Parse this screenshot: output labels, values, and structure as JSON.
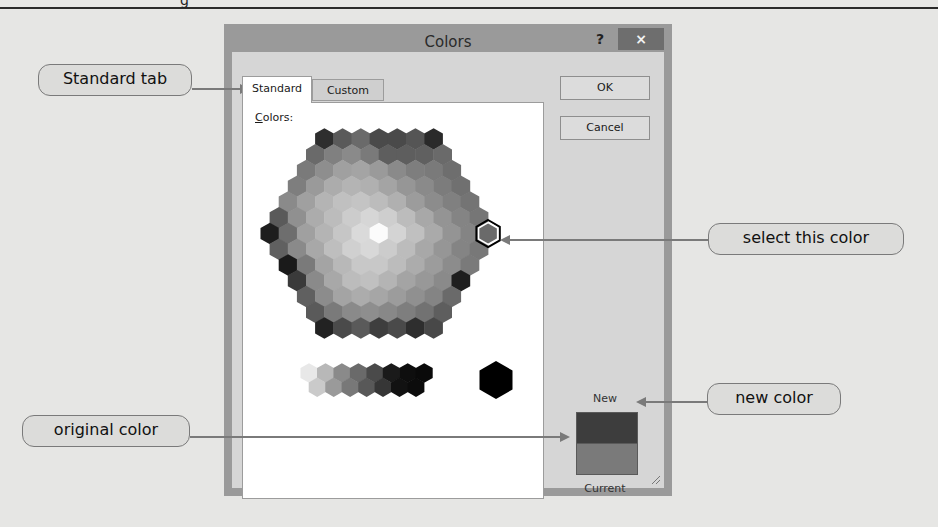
{
  "page": {
    "heading_fragment": "g"
  },
  "dialog": {
    "title": "Colors",
    "help_label": "?",
    "close_label": "×",
    "tabs": [
      {
        "label": "Standard",
        "active": true
      },
      {
        "label": "Custom",
        "active": false
      }
    ],
    "colors_label_accel": "C",
    "colors_label_rest": "olors:",
    "buttons": {
      "ok": "OK",
      "cancel": "Cancel"
    },
    "preview": {
      "new_label": "New",
      "current_label": "Current",
      "new_color": "#3d3d3d",
      "current_color": "#7a7a7a"
    },
    "selected_swatch": {
      "row": 6,
      "col": 12
    }
  },
  "callouts": [
    {
      "id": "standard-tab",
      "label": "Standard tab"
    },
    {
      "id": "select-this-color",
      "label": "select this color"
    },
    {
      "id": "new-color",
      "label": "new color"
    },
    {
      "id": "original-color",
      "label": "original color"
    }
  ],
  "hex_rows": [
    [
      "#2e2e2e",
      "#5a5a5a",
      "#6a6a6a",
      "#4a4a4a",
      "#4a4a4a",
      "#555555",
      "#2a2a2a"
    ],
    [
      "#6a6a6a",
      "#808080",
      "#8a8a8a",
      "#7a7a7a",
      "#5e5e5e",
      "#5e5e5e",
      "#606060",
      "#6a6a6a"
    ],
    [
      "#7a7a7a",
      "#8e8e8e",
      "#a0a0a0",
      "#a4a4a4",
      "#9a9a9a",
      "#8a8a8a",
      "#7e7e7e",
      "#7a7a7a",
      "#6e6e6e"
    ],
    [
      "#7e7e7e",
      "#9a9a9a",
      "#acacac",
      "#b4b4b4",
      "#b0b0b0",
      "#a4a4a4",
      "#969696",
      "#8a8a8a",
      "#7c7c7c",
      "#707070"
    ],
    [
      "#8a8a8a",
      "#a0a0a0",
      "#b4b4b4",
      "#c0c0c0",
      "#c4c4c4",
      "#bcbcbc",
      "#b0b0b0",
      "#9c9c9c",
      "#8c8c8c",
      "#808080",
      "#747474"
    ],
    [
      "#5a5a5a",
      "#909090",
      "#acacac",
      "#bcbcbc",
      "#cccccc",
      "#d6d6d6",
      "#cecece",
      "#bcbcbc",
      "#a8a8a8",
      "#949494",
      "#848484",
      "#767676"
    ],
    [
      "#1e1e1e",
      "#6e6e6e",
      "#a0a0a0",
      "#b4b4b4",
      "#c6c6c6",
      "#dadada",
      "#fbfbfb",
      "#d4d4d4",
      "#c0c0c0",
      "#aaaaaa",
      "#949494",
      "#848484",
      "#6a6a6a"
    ],
    [
      "#606060",
      "#8a8a8a",
      "#a8a8a8",
      "#bebebe",
      "#d0d0d0",
      "#d8d8d8",
      "#cccccc",
      "#bcbcbc",
      "#a8a8a8",
      "#969696",
      "#848484",
      "#787878"
    ],
    [
      "#1a1a1a",
      "#7a7a7a",
      "#a4a4a4",
      "#b8b8b8",
      "#c8c8c8",
      "#c8c8c8",
      "#bcbcbc",
      "#acacac",
      "#9c9c9c",
      "#8c8c8c",
      "#7a7a7a"
    ],
    [
      "#3a3a3a",
      "#8a8a8a",
      "#a8a8a8",
      "#bcbcbc",
      "#c0c0c0",
      "#b4b4b4",
      "#a4a4a4",
      "#989898",
      "#8a8a8a",
      "#1e1e1e"
    ],
    [
      "#606060",
      "#8c8c8c",
      "#a4a4a4",
      "#acacac",
      "#a6a6a6",
      "#9c9c9c",
      "#909090",
      "#848484",
      "#6a6a6a"
    ],
    [
      "#5a5a5a",
      "#7a7a7a",
      "#8a8a8a",
      "#8e8e8e",
      "#888888",
      "#7e7e7e",
      "#727272",
      "#5e5e5e"
    ],
    [
      "#222222",
      "#4a4a4a",
      "#5a5a5a",
      "#3e3e3e",
      "#4a4a4a",
      "#2e2e2e",
      "#484848"
    ]
  ],
  "gray_rows": [
    [
      "#e8e8e8",
      "#b8b8b8",
      "#8a8a8a",
      "#6a6a6a",
      "#4a4a4a",
      "#1a1a1a",
      "#0e0e0e",
      "#0a0a0a"
    ],
    [
      "#cacaca",
      "#9a9a9a",
      "#787878",
      "#585858",
      "#363636",
      "#121212",
      "#0c0c0c"
    ]
  ],
  "big_black": "#000000"
}
